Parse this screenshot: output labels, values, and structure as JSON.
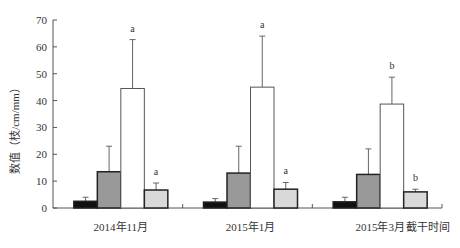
{
  "chart_data": {
    "type": "bar",
    "title": "",
    "xlabel": "截干时间",
    "ylabel": "数值（枝/cm/mm）",
    "ylim": [
      0,
      70
    ],
    "yticks": [
      0,
      10,
      20,
      30,
      40,
      50,
      60,
      70
    ],
    "grid": false,
    "legend": null,
    "categories": [
      "2014年11月",
      "2015年1月",
      "2015年3月"
    ],
    "series": [
      {
        "name": "series1",
        "color": "#111111",
        "values": [
          2.5,
          2.2,
          2.3
        ],
        "errors": [
          1.5,
          1.3,
          1.7
        ],
        "labels": [
          "",
          "",
          ""
        ]
      },
      {
        "name": "series2",
        "color": "#999999",
        "values": [
          13.5,
          13.0,
          12.5
        ],
        "errors": [
          9.5,
          10.0,
          9.5
        ],
        "labels": [
          "",
          "",
          ""
        ]
      },
      {
        "name": "series3",
        "color": "#ffffff",
        "values": [
          44.5,
          45.0,
          38.7
        ],
        "errors": [
          18.2,
          19.0,
          10.0
        ],
        "labels": [
          "a",
          "a",
          "b"
        ]
      },
      {
        "name": "series4",
        "color": "#d9d9d9",
        "values": [
          6.7,
          7.0,
          6.0
        ],
        "errors": [
          2.6,
          2.5,
          1.0
        ],
        "labels": [
          "a",
          "a",
          "b"
        ]
      }
    ]
  }
}
